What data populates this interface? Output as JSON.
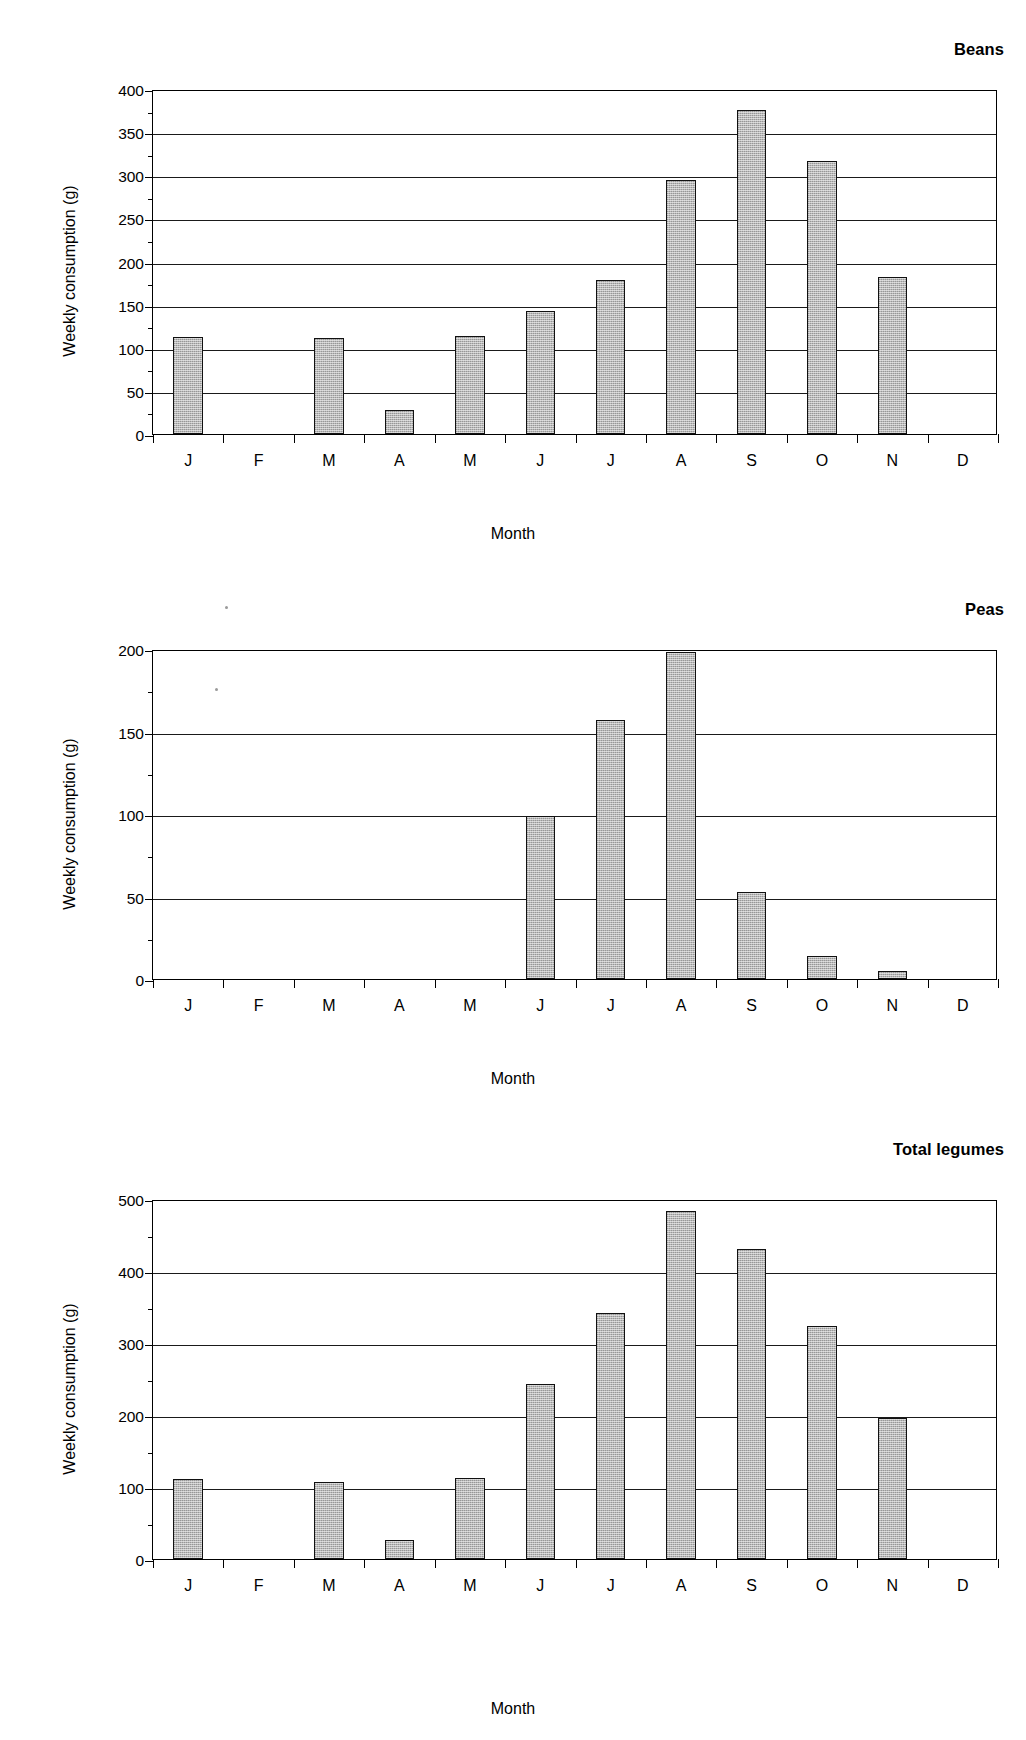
{
  "chart_data": [
    {
      "type": "bar",
      "title": "Beans",
      "xlabel": "Month",
      "ylabel": "Weekly consumption (g)",
      "categories": [
        "J",
        "F",
        "M",
        "A",
        "M",
        "J",
        "J",
        "A",
        "S",
        "O",
        "N",
        "D"
      ],
      "values": [
        113,
        0,
        111,
        28,
        114,
        143,
        179,
        295,
        376,
        316,
        182,
        0
      ],
      "ylim": [
        0,
        400
      ],
      "yticks": [
        0,
        50,
        100,
        150,
        200,
        250,
        300,
        350,
        400
      ],
      "ytick_labels": [
        "0",
        "50",
        "100",
        "150",
        "200",
        "250",
        "300",
        "350",
        "400"
      ],
      "grid": true,
      "legend": "none"
    },
    {
      "type": "bar",
      "title": "Peas",
      "xlabel": "Month",
      "ylabel": "Weekly consumption (g)",
      "categories": [
        "J",
        "F",
        "M",
        "A",
        "M",
        "J",
        "J",
        "A",
        "S",
        "O",
        "N",
        "D"
      ],
      "values": [
        0,
        0,
        0,
        0,
        0,
        99,
        157,
        198,
        53,
        14,
        5,
        0
      ],
      "ylim": [
        0,
        200
      ],
      "yticks": [
        0,
        50,
        100,
        150,
        200
      ],
      "ytick_labels": [
        "0",
        "50",
        "100",
        "150",
        "200"
      ],
      "grid": true,
      "legend": "none"
    },
    {
      "type": "bar",
      "title": "Total legumes",
      "xlabel": "Month",
      "ylabel": "Weekly consumption (g)",
      "categories": [
        "J",
        "F",
        "M",
        "A",
        "M",
        "J",
        "J",
        "A",
        "S",
        "O",
        "N",
        "D"
      ],
      "values": [
        111,
        0,
        107,
        27,
        112,
        243,
        341,
        484,
        430,
        324,
        196,
        0
      ],
      "ylim": [
        0,
        500
      ],
      "yticks": [
        0,
        100,
        200,
        300,
        400,
        500
      ],
      "ytick_labels": [
        "0",
        "100",
        "200",
        "300",
        "400",
        "500"
      ],
      "grid": true,
      "legend": "none"
    }
  ],
  "style": {
    "bar_fill": "#a8a8a8",
    "bar_border": "#111111",
    "axis_color": "#000000",
    "grid_color": "#1a1a1a",
    "background": "#ffffff"
  }
}
